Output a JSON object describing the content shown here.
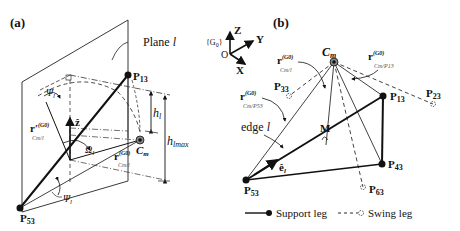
{
  "figure": {
    "panel_a": {
      "label": "(a)",
      "plane_label": "Plane ",
      "plane_index": "l",
      "points": {
        "p13": {
          "base": "P",
          "sub": "13"
        },
        "p53": {
          "base": "P",
          "sub": "53"
        },
        "cm": {
          "base": "C",
          "sub": "m"
        }
      },
      "z_hat": "ẑ",
      "psi_top": "Ψ",
      "psi_top_sub": "l",
      "psi_bottom": "Ψ",
      "psi_bottom_sub": "l",
      "omega": "Ω",
      "omega_sub": "l",
      "h_l": "h",
      "h_l_sub": "l",
      "h_lmax": "h",
      "h_lmax_sub": "l",
      "h_lmax_sub2": "max",
      "r_prime": "r′",
      "r_prime_sup": "(G0)",
      "r_prime_sub": "Cm/l",
      "r_vec": "r",
      "r_vec_sup": "(G0)",
      "r_vec_sub": "Cm/l"
    },
    "frame": {
      "name": "{G",
      "name_sub": "0",
      "name_close": "}",
      "origin": "O",
      "axes": [
        "Z",
        "Y",
        "X"
      ]
    },
    "panel_b": {
      "label": "(b)",
      "points": {
        "cm": {
          "base": "C",
          "sub": "m"
        },
        "p13": {
          "base": "P",
          "sub": "13"
        },
        "p23": {
          "base": "P",
          "sub": "23"
        },
        "p33": {
          "base": "P",
          "sub": "33"
        },
        "p43": {
          "base": "P",
          "sub": "43"
        },
        "p53": {
          "base": "P",
          "sub": "53"
        },
        "p63": {
          "base": "P",
          "sub": "63"
        },
        "m": "M"
      },
      "r_cml": {
        "base": "r",
        "sup": "(G0)",
        "sub": "Cm/l"
      },
      "r_cmp13": {
        "base": "r",
        "sup": "(G0)",
        "sub": "Cm/P13"
      },
      "r_cmp53": {
        "base": "r",
        "sup": "(G0)",
        "sub": "Cm/P53"
      },
      "edge_label": "edge ",
      "edge_index": "l",
      "e_hat": "ê",
      "e_hat_sub": "l"
    },
    "legend": {
      "support": "Support leg",
      "swing": "Swing leg"
    }
  }
}
